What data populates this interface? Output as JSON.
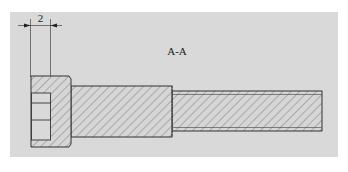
{
  "drawing": {
    "section_label": "A-A",
    "dimension_value": "2",
    "colors": {
      "panel": "#d9d9d9",
      "line": "#333333",
      "hatch": "#555555",
      "background": "#ffffff"
    },
    "parts": [
      {
        "name": "bolt-head",
        "description": "Socket head with internal socket"
      },
      {
        "name": "bolt-neck",
        "description": "Larger diameter body section"
      },
      {
        "name": "bolt-shaft",
        "description": "Smaller diameter shaft section"
      }
    ]
  }
}
